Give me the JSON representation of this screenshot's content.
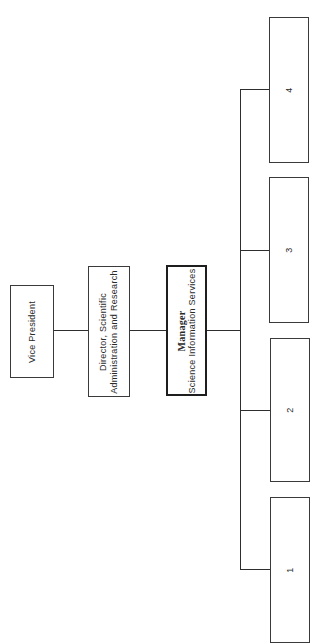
{
  "chart": {
    "orientation": "rotated-90-ccw",
    "nodes": {
      "vice_president": {
        "label": "Vice President"
      },
      "director": {
        "line1": "Director, Scientific",
        "line2": "Administration and Research"
      },
      "manager": {
        "title": "Manager",
        "subtitle": "Science Information Services"
      },
      "subordinates": [
        {
          "label": "1"
        },
        {
          "label": "2"
        },
        {
          "label": "3"
        },
        {
          "label": "4"
        }
      ]
    },
    "colors": {
      "line": "#2e2e2e",
      "border": "#3a3a3a",
      "background": "#ffffff"
    }
  }
}
